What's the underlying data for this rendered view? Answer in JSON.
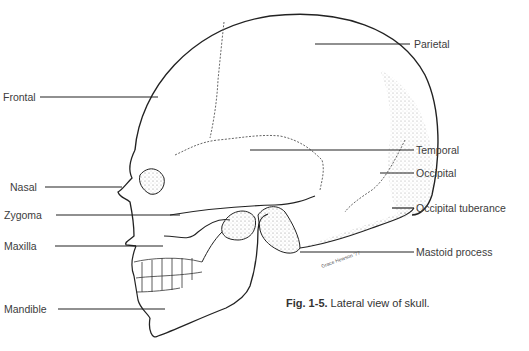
{
  "figure": {
    "caption_number": "Fig. 1-5.",
    "caption_text": " Lateral view of skull.",
    "signature": "Grace Hewson '77"
  },
  "labels": {
    "parietal": "Parietal",
    "frontal": "Frontal",
    "temporal": "Temporal",
    "occipital": "Occipital",
    "nasal": "Nasal",
    "zygoma": "Zygoma",
    "occipital_tuberance": "Occipital tuberance",
    "maxilla": "Maxilla",
    "mastoid_process": "Mastoid process",
    "mandible": "Mandible"
  },
  "colors": {
    "line": "#222222",
    "text": "#3c3c3c",
    "stipple": "#9a9a9a"
  }
}
